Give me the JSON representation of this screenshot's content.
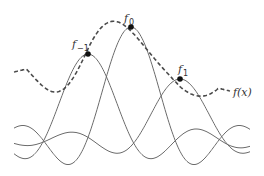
{
  "diagram": {
    "colors": {
      "background": "#ffffff",
      "basis_curve": "#6b6b6b",
      "interpolant": "#4a4a4a",
      "sample_point": "#111111",
      "text": "#333333"
    },
    "samples": [
      {
        "id": "f_minus_1",
        "base": "f",
        "sub": "−1",
        "x": 88,
        "y": 54,
        "label_x": 72,
        "label_y": 48
      },
      {
        "id": "f_0",
        "base": "f",
        "sub": "0",
        "x": 131,
        "y": 27,
        "label_x": 124,
        "label_y": 22
      },
      {
        "id": "f_1",
        "base": "f",
        "sub": "1",
        "x": 180,
        "y": 79,
        "label_x": 178,
        "label_y": 73
      }
    ],
    "interpolant_label": "f(x)",
    "interpolant_label_pos": {
      "x": 233,
      "y": 96
    },
    "basis_functions": [
      {
        "center": 88,
        "peak_y": 54,
        "spacing": 44
      },
      {
        "center": 131,
        "peak_y": 27,
        "spacing": 44
      },
      {
        "center": 180,
        "peak_y": 79,
        "spacing": 44
      }
    ],
    "baseline_y": 140,
    "x_range": [
      14,
      250
    ],
    "interpolant_range": [
      14,
      230
    ]
  }
}
